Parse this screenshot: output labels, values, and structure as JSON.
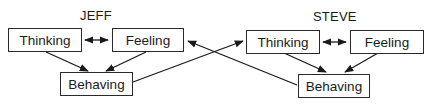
{
  "diagram": {
    "groups": [
      {
        "name": "JEFF",
        "nodes": {
          "thinking": "Thinking",
          "feeling": "Feeling",
          "behaving": "Behaving"
        }
      },
      {
        "name": "STEVE",
        "nodes": {
          "thinking": "Thinking",
          "feeling": "Feeling",
          "behaving": "Behaving"
        }
      }
    ],
    "edges": [
      {
        "from": "JEFF.thinking",
        "to": "JEFF.feeling",
        "type": "bidirectional"
      },
      {
        "from": "JEFF.thinking",
        "to": "JEFF.behaving",
        "type": "directed"
      },
      {
        "from": "JEFF.feeling",
        "to": "JEFF.behaving",
        "type": "directed"
      },
      {
        "from": "STEVE.thinking",
        "to": "STEVE.feeling",
        "type": "bidirectional"
      },
      {
        "from": "STEVE.thinking",
        "to": "STEVE.behaving",
        "type": "directed"
      },
      {
        "from": "STEVE.feeling",
        "to": "STEVE.behaving",
        "type": "directed"
      },
      {
        "from": "JEFF.behaving",
        "to": "STEVE.thinking",
        "type": "directed"
      },
      {
        "from": "STEVE.behaving",
        "to": "JEFF.feeling",
        "type": "directed"
      }
    ]
  }
}
